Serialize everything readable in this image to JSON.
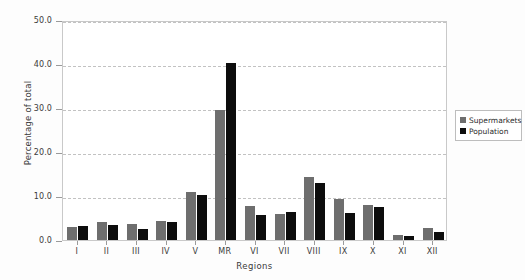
{
  "chart_data": {
    "type": "bar",
    "title": "",
    "xlabel": "Regions",
    "ylabel": "Percentage of total",
    "categories": [
      "I",
      "II",
      "III",
      "IV",
      "V",
      "MR",
      "VI",
      "VII",
      "VIII",
      "IX",
      "X",
      "XI",
      "XII"
    ],
    "series": [
      {
        "name": "Supermarkets",
        "color": "#6e6e6e",
        "values": [
          2.9,
          4.0,
          3.6,
          4.3,
          10.8,
          29.5,
          7.7,
          5.9,
          14.3,
          9.4,
          8.0,
          1.2,
          2.7
        ]
      },
      {
        "name": "Population",
        "color": "#0d0d0d",
        "values": [
          3.2,
          3.4,
          2.4,
          4.1,
          10.3,
          40.2,
          5.6,
          6.3,
          13.0,
          6.1,
          7.5,
          0.9,
          1.8
        ]
      }
    ],
    "ylim": [
      0.0,
      50.0
    ],
    "yticks": [
      "0.0",
      "10.0",
      "20.0",
      "30.0",
      "40.0",
      "50.0"
    ],
    "ytick_values": [
      0,
      10,
      20,
      30,
      40,
      50
    ],
    "grid": true,
    "grid_axis": "y",
    "legend_position": "right-outside"
  },
  "legend": {
    "entries": [
      {
        "label": "Supermarkets",
        "color": "#6e6e6e"
      },
      {
        "label": "Population",
        "color": "#0d0d0d"
      }
    ]
  },
  "axes": {
    "y_title": "Percentage of total",
    "x_title": "Regions"
  }
}
